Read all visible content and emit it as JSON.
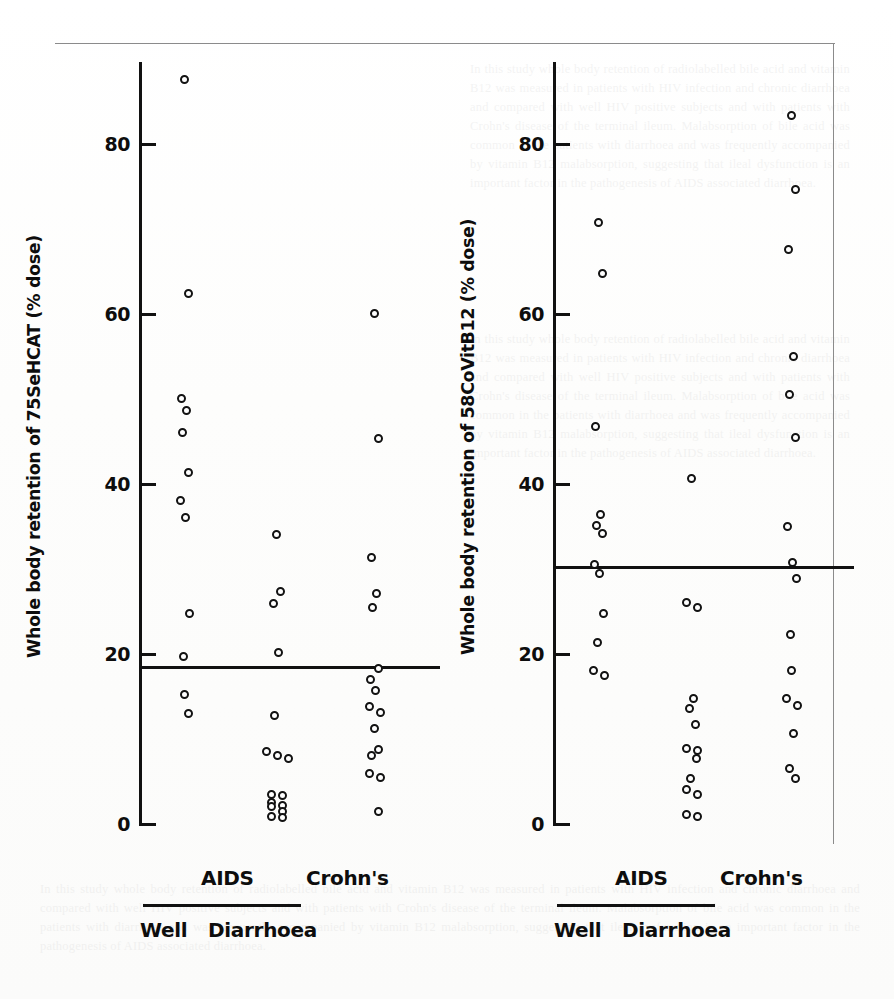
{
  "figure": {
    "background_color": "#ffffff",
    "ink_color": "#111111",
    "page_rule_color": "#8b8b8b",
    "ghost_text": "In this study whole body retention of radiolabelled bile acid and vitamin B12 was measured in patients with HIV infection and chronic diarrhoea and compared with well HIV positive subjects and with patients with Crohn's disease of the terminal ileum. Malabsorption of bile acid was common in the patients with diarrhoea and was frequently accompanied by vitamin B12 malabsorption, suggesting that ileal dysfunction is an important factor in the pathogenesis of AIDS associated diarrhoea."
  },
  "chart_data": [
    {
      "panel": "left",
      "type": "scatter",
      "title": "",
      "ylabel": "Whole body retention of 75SeHCAT (% dose)",
      "xlabel": "",
      "ylim": [
        0,
        88
      ],
      "yticks": [
        0,
        20,
        40,
        60,
        80
      ],
      "ytick_labels": [
        "0",
        "20",
        "40",
        "60",
        "80"
      ],
      "grid": false,
      "legend": "none",
      "median_line": 18.7,
      "median_line_label": "",
      "categories": [
        "Well",
        "Diarrhoea",
        "Crohn's"
      ],
      "series": [
        {
          "name": "Well",
          "values": [
            87.5,
            62.3,
            50.0,
            48.5,
            46.0,
            41.2,
            38.0,
            35.9,
            24.6,
            19.6,
            15.1,
            12.9
          ]
        },
        {
          "name": "Diarrhoea",
          "values": [
            34.0,
            27.2,
            25.8,
            20.1,
            12.7,
            8.4,
            8.0,
            7.6,
            3.4,
            3.2,
            2.4,
            2.1,
            1.9,
            1.4,
            0.8,
            0.7
          ]
        },
        {
          "name": "Crohn's",
          "values": [
            60.0,
            45.2,
            31.2,
            27.0,
            25.3,
            18.2,
            16.9,
            15.6,
            13.7,
            13.0,
            11.1,
            8.6,
            7.9,
            5.8,
            5.4,
            1.3
          ]
        }
      ]
    },
    {
      "panel": "right",
      "type": "scatter",
      "title": "",
      "ylabel": "Whole body retention of 58CoVitB12 (% dose)",
      "xlabel": "",
      "ylim": [
        0,
        88
      ],
      "yticks": [
        0,
        20,
        40,
        60,
        80
      ],
      "ytick_labels": [
        "0",
        "20",
        "40",
        "60",
        "80"
      ],
      "grid": false,
      "legend": "none",
      "median_line": 30.3,
      "median_line_label": "",
      "categories": [
        "Well",
        "Diarrhoea",
        "Crohn's"
      ],
      "series": [
        {
          "name": "Well",
          "values": [
            70.6,
            64.7,
            46.6,
            36.3,
            35.0,
            34.1,
            30.4,
            29.4,
            24.7,
            21.2,
            17.9,
            17.4
          ]
        },
        {
          "name": "Diarrhoea",
          "values": [
            40.5,
            26.0,
            25.4,
            14.6,
            13.5,
            11.6,
            8.8,
            8.5,
            7.6,
            5.2,
            3.9,
            3.3,
            1.0,
            0.8
          ]
        },
        {
          "name": "Crohn's",
          "values": [
            83.2,
            74.5,
            67.5,
            54.9,
            50.4,
            45.3,
            34.9,
            30.6,
            28.8,
            22.2,
            18.0,
            14.7,
            13.8,
            10.5,
            6.4,
            5.2
          ]
        }
      ]
    }
  ],
  "panels": {
    "left": {
      "axis_title": "Whole body retention of 75SeHCAT (% dose)",
      "tick_labels": [
        "80",
        "60",
        "40",
        "20",
        "0"
      ],
      "category_labels": {
        "aids": "AIDS",
        "crohns": "Crohn's",
        "well": "Well",
        "diarrhoea": "Diarrhoea"
      }
    },
    "right": {
      "axis_title": "Whole body retention of 58CoVitB12 (% dose)",
      "tick_labels": [
        "80",
        "60",
        "40",
        "20",
        "0"
      ],
      "category_labels": {
        "aids": "AIDS",
        "crohns": "Crohn's",
        "well": "Well",
        "diarrhoea": "Diarrhoea"
      }
    }
  }
}
